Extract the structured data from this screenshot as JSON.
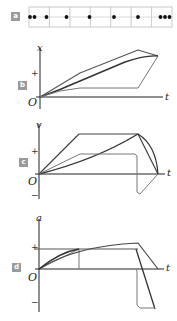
{
  "panels": {
    "a": {
      "badge": "a",
      "type": "dot-strip",
      "cells": 7,
      "dot_x": [
        30,
        35,
        47,
        67,
        90,
        115,
        138,
        161,
        166,
        171
      ]
    },
    "b": {
      "badge": "b",
      "y_label": "x",
      "x_label": "t",
      "origin": "O",
      "plus": "+"
    },
    "c": {
      "badge": "c",
      "y_label": "v",
      "x_label": "t",
      "origin": "O",
      "plus": "+",
      "minus": "−"
    },
    "d": {
      "badge": "d",
      "y_label": "a",
      "x_label": "t",
      "origin": "O",
      "plus": "+",
      "minus": "−"
    }
  },
  "colors": {
    "badge": "#9a9a9a",
    "axis": "#222222",
    "dark_line": "#333333",
    "light_line": "#777777",
    "grid": "#bbbbbb"
  }
}
